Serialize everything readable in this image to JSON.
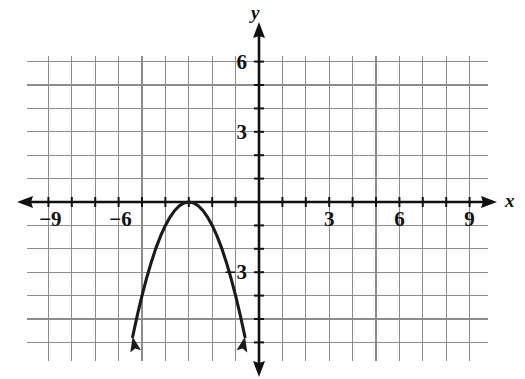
{
  "figure": {
    "kind": "cartesian-coordinate-plane",
    "axis_labels": {
      "x": "x",
      "y": "y"
    },
    "background_color": "#ffffff",
    "grid_color": "#8c8c8c",
    "axis_color": "#111111",
    "curve_color": "#1a1a1a"
  },
  "chart_data": {
    "type": "line",
    "title": "",
    "xlabel": "x",
    "ylabel": "y",
    "grid": true,
    "legend": "none",
    "xlim": [
      -9.0,
      9.0
    ],
    "ylim": [
      -6.2,
      6.2
    ],
    "xticks": [
      -9,
      -6,
      3,
      6,
      9
    ],
    "xtick_labels": [
      "−9",
      "−6",
      "3",
      "6",
      "9"
    ],
    "yticks": [
      6,
      3,
      -3
    ],
    "ytick_labels": [
      "6",
      "3",
      "−3"
    ],
    "x_minor_step": 1,
    "y_minor_step": 1,
    "series": [
      {
        "name": "parabola",
        "equation": "y = -(x + 3)^2",
        "vertex": [
          -3,
          0
        ],
        "opens": "down",
        "arrow_ends": true,
        "x": [
          -5.4,
          -5.2,
          -5.0,
          -4.8,
          -4.6,
          -4.4,
          -4.2,
          -4.0,
          -3.8,
          -3.6,
          -3.4,
          -3.2,
          -3.0,
          -2.8,
          -2.6,
          -2.4,
          -2.2,
          -2.0,
          -1.8,
          -1.6,
          -1.4,
          -1.2,
          -1.0,
          -0.8,
          -0.6
        ],
        "values": [
          -5.76,
          -4.84,
          -4.0,
          -3.24,
          -2.56,
          -1.96,
          -1.44,
          -1.0,
          -0.64,
          -0.36,
          -0.16,
          -0.04,
          0.0,
          -0.04,
          -0.16,
          -0.36,
          -0.64,
          -1.0,
          -1.44,
          -1.96,
          -2.56,
          -3.24,
          -4.0,
          -4.84,
          -5.76
        ]
      }
    ],
    "annotations": []
  }
}
